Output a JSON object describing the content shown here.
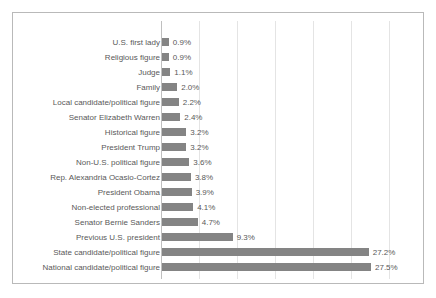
{
  "chart_data": {
    "type": "bar",
    "orientation": "horizontal",
    "title": "",
    "subtitle": "",
    "xlabel": "",
    "ylabel": "",
    "xlim": [
      0,
      30
    ],
    "grid": "vertical",
    "gridline_values": [
      5,
      10,
      15,
      20,
      25,
      30
    ],
    "legend": "none",
    "value_suffix": "%",
    "bar_color": "#848484",
    "gridline_color": "#e4e4e4",
    "axis_color": "#bfbfbf",
    "border_color": "#b9b9b9",
    "text_color": "#595959",
    "categories": [
      "U.S. first lady",
      "Religious figure",
      "Judge",
      "Family",
      "Local candidate/political figure",
      "Senator Elizabeth Warren",
      "Historical figure",
      "President Trump",
      "Non-U.S. political figure",
      "Rep. Alexandria Ocasio-Cortez",
      "President Obama",
      "Non-elected professional",
      "Senator Bernie Sanders",
      "Previous U.S. president",
      "State candidate/political figure",
      "National candidate/political figure"
    ],
    "values": [
      0.9,
      0.9,
      1.1,
      2.0,
      2.2,
      2.4,
      3.2,
      3.2,
      3.6,
      3.8,
      3.9,
      4.1,
      4.7,
      9.3,
      27.2,
      27.5
    ],
    "value_labels": [
      "0.9%",
      "0.9%",
      "1.1%",
      "2.0%",
      "2.2%",
      "2.4%",
      "3.2%",
      "3.2%",
      "3.6%",
      "3.8%",
      "3.9%",
      "4.1%",
      "4.7%",
      "9.3%",
      "27.2%",
      "27.5%"
    ]
  }
}
